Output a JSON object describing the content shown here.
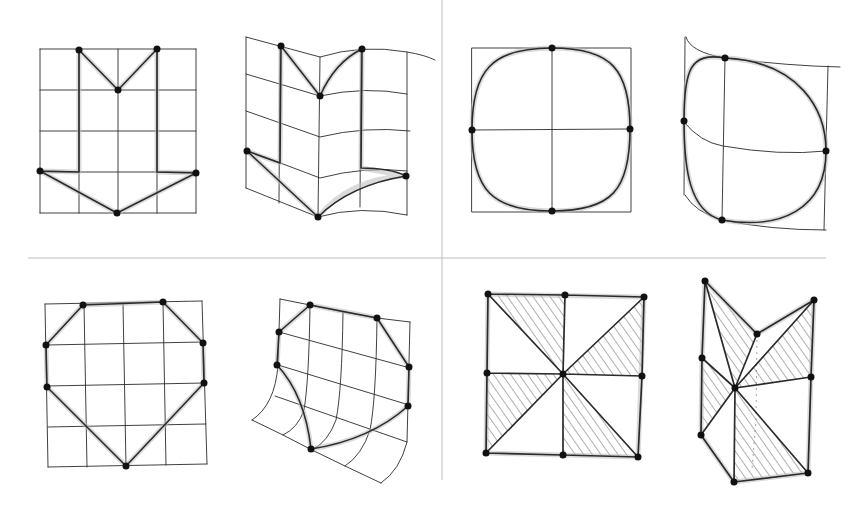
{
  "figure": {
    "colors": {
      "ink": "#2b2b2b",
      "dot": "#111111",
      "halo": "#bdbdbd",
      "divider": "#bdbdbd",
      "background": "#ffffff"
    },
    "dividers": {
      "vertical_x": 442,
      "horizontal_y": 258
    },
    "quadrants": [
      {
        "id": "top-left",
        "shape": "M / arrow-shaped polygon",
        "panels": [
          {
            "id": "panel-1",
            "state": "original",
            "grid": "4x4 regular grid",
            "control_points": 6
          },
          {
            "id": "panel-2",
            "state": "deformed",
            "grid": "4x4 grid folded at center crease, right half curved",
            "control_points": 6
          }
        ]
      },
      {
        "id": "top-right",
        "shape": "rounded square (circle-like) curve",
        "panels": [
          {
            "id": "panel-3",
            "state": "original",
            "grid": "2x2 regular grid",
            "control_points": 4
          },
          {
            "id": "panel-4",
            "state": "deformed",
            "grid": "2x2 skewed/curved grid",
            "control_points": 4
          }
        ]
      },
      {
        "id": "bottom-left",
        "shape": "heptagon / shield-like polygon",
        "panels": [
          {
            "id": "panel-5",
            "state": "original",
            "grid": "4x4 regular grid",
            "control_points": 7
          },
          {
            "id": "panel-6",
            "state": "deformed",
            "grid": "4x4 grid curling at bottom-left",
            "control_points": 7
          }
        ]
      },
      {
        "id": "bottom-right",
        "shape": "pinwheel of four hatched triangles",
        "panels": [
          {
            "id": "panel-7",
            "state": "original",
            "grid": "3x3 vertex mesh",
            "control_points": 9,
            "hatched_triangles": 4
          },
          {
            "id": "panel-8",
            "state": "deformed",
            "grid": "3x3 vertex mesh displaced",
            "control_points": 9,
            "hatched_triangles": 4
          }
        ]
      }
    ]
  }
}
